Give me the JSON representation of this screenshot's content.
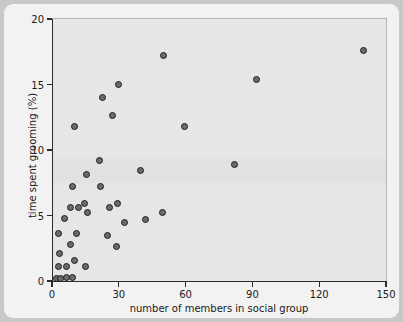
{
  "chart_data": {
    "type": "scatter",
    "title": "",
    "xlabel": "number of members in social group",
    "ylabel": "time spent grooming (%)",
    "xlim": [
      0,
      150
    ],
    "ylim": [
      0,
      20
    ],
    "xticks": [
      0,
      30,
      60,
      90,
      120,
      150
    ],
    "yticks": [
      0,
      5,
      10,
      15,
      20
    ],
    "xticklabels": [
      "0",
      "30",
      "60",
      "90",
      "120",
      "150"
    ],
    "yticklabels": [
      "0",
      "5",
      "10",
      "15",
      "20"
    ],
    "grid": false,
    "legend": null,
    "marker": {
      "shape": "circle",
      "fill": "#6b6b6b",
      "edge": "#1f1f1f",
      "size": 7
    },
    "points": [
      {
        "x": 2.2,
        "y": 0.2
      },
      {
        "x": 3.1,
        "y": 1.1
      },
      {
        "x": 3.4,
        "y": 2.1
      },
      {
        "x": 2.7,
        "y": 3.6
      },
      {
        "x": 4.0,
        "y": 0.2
      },
      {
        "x": 5.4,
        "y": 4.8
      },
      {
        "x": 6.3,
        "y": 1.1
      },
      {
        "x": 6.7,
        "y": 0.25
      },
      {
        "x": 8.1,
        "y": 2.8
      },
      {
        "x": 8.5,
        "y": 5.6
      },
      {
        "x": 9.0,
        "y": 0.25
      },
      {
        "x": 9.4,
        "y": 7.2
      },
      {
        "x": 9.9,
        "y": 11.8
      },
      {
        "x": 10.3,
        "y": 1.6
      },
      {
        "x": 11.2,
        "y": 3.6
      },
      {
        "x": 12.1,
        "y": 5.6
      },
      {
        "x": 14.8,
        "y": 5.9
      },
      {
        "x": 15.2,
        "y": 1.1
      },
      {
        "x": 15.7,
        "y": 8.1
      },
      {
        "x": 16.1,
        "y": 5.2
      },
      {
        "x": 21.5,
        "y": 9.2
      },
      {
        "x": 22.0,
        "y": 7.2
      },
      {
        "x": 22.8,
        "y": 14.0
      },
      {
        "x": 25.1,
        "y": 3.5
      },
      {
        "x": 26.0,
        "y": 5.6
      },
      {
        "x": 27.3,
        "y": 12.6
      },
      {
        "x": 29.1,
        "y": 2.6
      },
      {
        "x": 29.6,
        "y": 5.9
      },
      {
        "x": 30.0,
        "y": 15.0
      },
      {
        "x": 32.7,
        "y": 4.5
      },
      {
        "x": 39.9,
        "y": 8.4
      },
      {
        "x": 42.1,
        "y": 4.7
      },
      {
        "x": 49.8,
        "y": 5.2
      },
      {
        "x": 50.2,
        "y": 17.2
      },
      {
        "x": 59.4,
        "y": 11.8
      },
      {
        "x": 81.8,
        "y": 8.9
      },
      {
        "x": 91.8,
        "y": 15.4
      },
      {
        "x": 139.8,
        "y": 17.6
      }
    ]
  }
}
